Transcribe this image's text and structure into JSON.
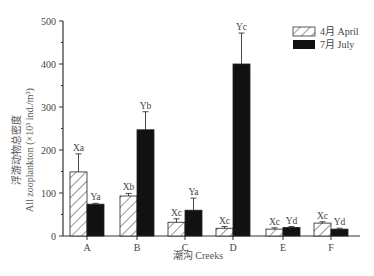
{
  "chart_data": {
    "type": "bar",
    "title": "",
    "xlabel": "潮沟 Creeks",
    "ylabel_cn": "浮游动物总密度",
    "ylabel": "All zooplankton (×10³ ind./m³)",
    "ylim": [
      0,
      500
    ],
    "yticks": [
      0,
      100,
      200,
      300,
      400,
      500
    ],
    "grid": false,
    "legend_position": "top-right",
    "categories": [
      "A",
      "B",
      "C",
      "D",
      "E",
      "F"
    ],
    "series": [
      {
        "name": "4月 April",
        "pattern": "hatched",
        "values": [
          149,
          93,
          32,
          18,
          16,
          30
        ],
        "error": [
          42,
          6,
          8,
          4,
          3,
          3
        ],
        "labels": [
          "Xa",
          "Xb",
          "Xc",
          "Xc",
          "Xc",
          "Xc"
        ]
      },
      {
        "name": "7月 July",
        "pattern": "solid-black",
        "values": [
          74,
          247,
          60,
          400,
          20,
          16
        ],
        "error": [
          2,
          42,
          28,
          72,
          2,
          2
        ],
        "labels": [
          "Ya",
          "Yb",
          "Ya",
          "Yc",
          "Yd",
          "Yd"
        ]
      }
    ]
  },
  "legend": {
    "april": "4月  April",
    "july": "7月  July"
  },
  "axis": {
    "x_title": "潮沟  Creeks",
    "y_title_cn": "浮游动物总密度",
    "y_title_en": "All zooplankton (×10³ ind./m³)"
  },
  "colors": {
    "axis": "#333333",
    "july_fill": "#111111",
    "april_hatch": "#333333"
  }
}
